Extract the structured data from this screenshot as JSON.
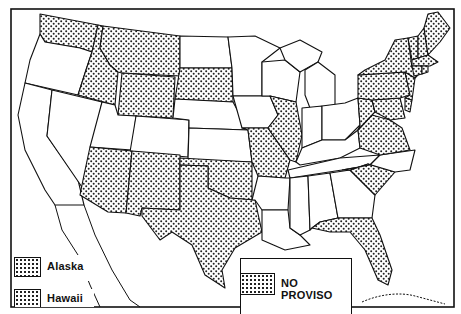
{
  "map": {
    "subject": "Contiguous United States",
    "shaded_states": [
      "WA",
      "ID",
      "MT",
      "WY",
      "SD",
      "AZ",
      "NM",
      "TX",
      "OK",
      "MO",
      "IL",
      "ME",
      "NH",
      "VT",
      "MA",
      "RI",
      "CT",
      "NY",
      "PA",
      "NJ",
      "DE",
      "MD",
      "WV",
      "VA",
      "SC",
      "FL"
    ],
    "unshaded_states": [
      "OR",
      "CA",
      "NV",
      "UT",
      "CO",
      "ND",
      "NE",
      "KS",
      "MN",
      "IA",
      "WI",
      "MI",
      "IN",
      "OH",
      "KY",
      "TN",
      "AR",
      "LA",
      "MS",
      "AL",
      "GA",
      "NC"
    ],
    "pattern": "dot-stipple",
    "colors": {
      "ink": "#111111",
      "paper": "#ffffff"
    }
  },
  "legend": {
    "main_label": "NO PROVISO",
    "insets": [
      {
        "label": "Alaska",
        "shaded": true
      },
      {
        "label": "Hawaii",
        "shaded": true
      }
    ]
  }
}
